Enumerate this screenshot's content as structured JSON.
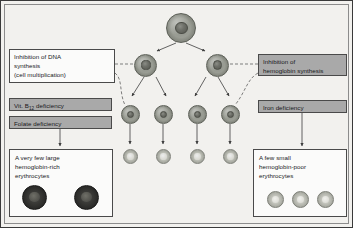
{
  "figure": {
    "background_color": "#f2f1ee",
    "frame_color": "#3a3a3a"
  },
  "left_pathway": {
    "mechanism_box": {
      "line1": "Inhibition of DNA",
      "line2": "synthesis",
      "line3": "(cell multiplication)",
      "fill": "#fbfbfa"
    },
    "causes": [
      {
        "prefix": "Vit. B",
        "subscript": "12",
        "suffix": " deficiency",
        "fill": "#a9a9a9"
      },
      {
        "label": "Folate deficiency",
        "fill": "#a9a9a9"
      }
    ],
    "outcome_box": {
      "line1": "A very few large",
      "line2": "hemoglobin-rich",
      "line3": "erythrocytes",
      "fill": "#fbfbfa",
      "cell_count": 2,
      "cell_type": "macrocyte",
      "cell_color": "#2b2b29"
    }
  },
  "right_pathway": {
    "mechanism_box": {
      "line1": "Inhibition of",
      "line2": "hemoglobin synthesis",
      "fill": "#a9a9a9"
    },
    "causes": [
      {
        "label": "Iron deficiency",
        "fill": "#a9a9a9"
      }
    ],
    "outcome_box": {
      "line1": "A few small",
      "line2": "hemoglobin-poor",
      "line3": "erythrocytes",
      "fill": "#fbfbfa",
      "cell_count": 3,
      "cell_type": "microcyte",
      "cell_color": "#c6c7bf"
    }
  },
  "cell_lineage": {
    "generations": [
      {
        "name": "stem-cell",
        "count": 1,
        "cell_type": "nucleated-progenitor",
        "size_px": 30
      },
      {
        "name": "second-generation",
        "count": 2,
        "cell_type": "nucleated-progenitor",
        "size_px": 22
      },
      {
        "name": "third-generation",
        "count": 4,
        "cell_type": "nucleated-progenitor",
        "size_px": 19
      },
      {
        "name": "mature-erythrocyte",
        "count": 4,
        "cell_type": "erythrocyte",
        "size_px": 15
      }
    ],
    "arrow_color": "#3d3d3d",
    "dashed_link_color": "#4a4a4a"
  }
}
